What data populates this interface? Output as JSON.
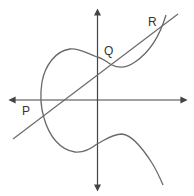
{
  "diagram": {
    "points": [
      {
        "label": "P",
        "x": 22,
        "y": 105
      },
      {
        "label": "Q",
        "x": 104,
        "y": 45
      },
      {
        "label": "R",
        "x": 148,
        "y": 16
      }
    ],
    "colors": {
      "curve": "#6a6a6a",
      "axes": "#444444",
      "line": "#6a6a6a",
      "text": "#333333"
    }
  }
}
